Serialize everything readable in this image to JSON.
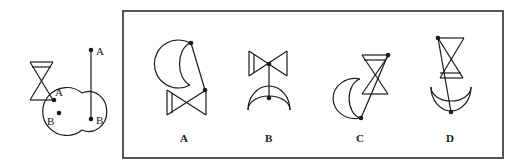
{
  "question": {
    "given": {
      "shapes": [
        "hourglass",
        "crescent-moon",
        "line-segment"
      ],
      "point_labels": {
        "hourglass_point": "A",
        "moon_point": "B",
        "segment_top": "A",
        "segment_bottom": "B"
      }
    },
    "options": [
      {
        "label": "A"
      },
      {
        "label": "B"
      },
      {
        "label": "C"
      },
      {
        "label": "D"
      }
    ]
  },
  "colors": {
    "stroke": "#1a1a1a",
    "frame": "#555555",
    "background": "#ffffff"
  }
}
